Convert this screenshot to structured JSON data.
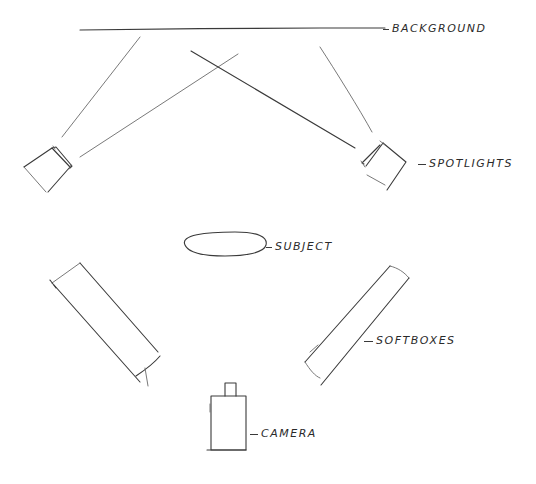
{
  "diagram": {
    "type": "hand-drawn studio lighting layout sketch",
    "stroke_color": "#3a3a3a",
    "background_color": "#ffffff",
    "labels": {
      "background": "BACKGROUND",
      "spotlights": "SPOTLIGHTS",
      "subject": "SUBJECT",
      "softboxes": "SOFTBOXES",
      "camera": "CAMERA"
    },
    "elements": [
      {
        "id": "background",
        "shape": "line",
        "label": "BACKGROUND"
      },
      {
        "id": "spotlight-left",
        "shape": "rotated-square",
        "label": "SPOTLIGHTS"
      },
      {
        "id": "spotlight-right",
        "shape": "rotated-square",
        "label": "SPOTLIGHTS"
      },
      {
        "id": "subject",
        "shape": "ellipse",
        "label": "SUBJECT"
      },
      {
        "id": "softbox-left",
        "shape": "rotated-rectangle",
        "label": "SOFTBOXES"
      },
      {
        "id": "softbox-right",
        "shape": "rotated-rectangle",
        "label": "SOFTBOXES"
      },
      {
        "id": "camera",
        "shape": "rectangle-with-lens",
        "label": "CAMERA"
      }
    ],
    "connections": [
      {
        "from": "spotlight-left",
        "to": "background",
        "type": "light-beam"
      },
      {
        "from": "spotlight-right",
        "to": "background",
        "type": "light-beam"
      }
    ]
  }
}
